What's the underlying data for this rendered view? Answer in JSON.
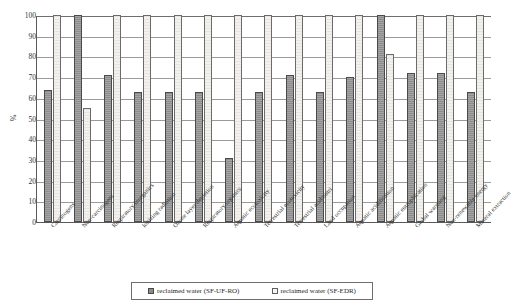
{
  "chart_data": {
    "type": "bar",
    "title": "",
    "xlabel": "",
    "ylabel": "%",
    "ylim": [
      0,
      100
    ],
    "yticks": [
      0,
      10,
      20,
      30,
      40,
      50,
      60,
      70,
      80,
      90,
      100
    ],
    "grid": true,
    "legend_position": "bottom",
    "categories": [
      "Carcinogens",
      "Non-carcinogens",
      "Respiratory inorganics",
      "Ionizing radiation",
      "Ozone layer depletion",
      "Respiratory organics",
      "Aquatic ecotoxicity",
      "Terrestrial ecotoxicity",
      "Terrestrial acid/nutri",
      "Land occupation",
      "Aquatic acidification",
      "Aquatic eutrophication",
      "Global warming",
      "Non-renewable energy",
      "Mineral extraction"
    ],
    "series": [
      {
        "name": "reclaimed water (SF-UF-RO)",
        "color": "#8c8c8c",
        "values": [
          64,
          100,
          71,
          63,
          63,
          63,
          31,
          63,
          71,
          63,
          70,
          100,
          72,
          72,
          63
        ]
      },
      {
        "name": "reclaimed water (SF-EDR)",
        "color": "#f2f1ee",
        "values": [
          100,
          55,
          100,
          100,
          100,
          100,
          100,
          100,
          100,
          100,
          100,
          81,
          100,
          100,
          100
        ]
      }
    ]
  },
  "legend": {
    "items": [
      {
        "label": "reclaimed water (SF-UF-RO)",
        "swatch": "dark-swatch-icon"
      },
      {
        "label": "reclaimed water (SF-EDR)",
        "swatch": "light-swatch-icon"
      }
    ]
  }
}
